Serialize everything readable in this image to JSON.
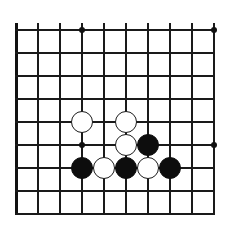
{
  "figure": {
    "kind": "go-board-diagram",
    "background_color": "#ffffff",
    "line_color": "#1a1a1a",
    "black_stone_color": "#0d0d0d",
    "white_stone_color": "#ffffff",
    "white_stone_outline_color": "#1a1a1a"
  },
  "board": {
    "visible_columns": 10,
    "visible_rows": 9,
    "origin_x": 16,
    "origin_y": 30,
    "col_spacing": 22,
    "row_spacing": 23,
    "stone_radius": 11,
    "line_overhang_top": 7,
    "line_overhang_bottom": 0
  },
  "star_points": [
    {
      "col": 3,
      "row": 0
    },
    {
      "col": 9,
      "row": 0
    },
    {
      "col": 3,
      "row": 5
    },
    {
      "col": 9,
      "row": 5
    }
  ],
  "stones": [
    {
      "color": "white",
      "col": 3,
      "row": 4,
      "label": "white-stone-c3r4"
    },
    {
      "color": "white",
      "col": 5,
      "row": 4,
      "label": "white-stone-c5r4"
    },
    {
      "color": "white",
      "col": 5,
      "row": 5,
      "label": "white-stone-c5r5"
    },
    {
      "color": "black",
      "col": 6,
      "row": 5,
      "label": "black-stone-c6r5"
    },
    {
      "color": "black",
      "col": 3,
      "row": 6,
      "label": "black-stone-c3r6"
    },
    {
      "color": "white",
      "col": 4,
      "row": 6,
      "label": "white-stone-c4r6"
    },
    {
      "color": "black",
      "col": 5,
      "row": 6,
      "label": "black-stone-c5r6"
    },
    {
      "color": "white",
      "col": 6,
      "row": 6,
      "label": "white-stone-c6r6"
    },
    {
      "color": "black",
      "col": 7,
      "row": 6,
      "label": "black-stone-c7r6"
    }
  ],
  "counts": {
    "black_stones": 4,
    "white_stones": 5,
    "total_stones": 9
  }
}
